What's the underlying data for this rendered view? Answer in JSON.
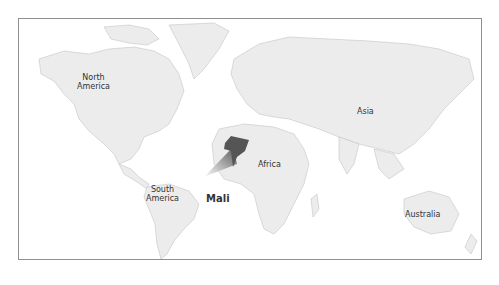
{
  "map": {
    "labels": {
      "north_america": [
        "North",
        "America"
      ],
      "south_america": [
        "South",
        "America"
      ],
      "africa": "Africa",
      "asia": "Asia",
      "australia": "Australia",
      "highlight": "Mali"
    },
    "colors": {
      "land": "#ececec",
      "borders": "#c4c4c4",
      "highlight": "#555555",
      "frame": "#8f8f8f"
    }
  }
}
